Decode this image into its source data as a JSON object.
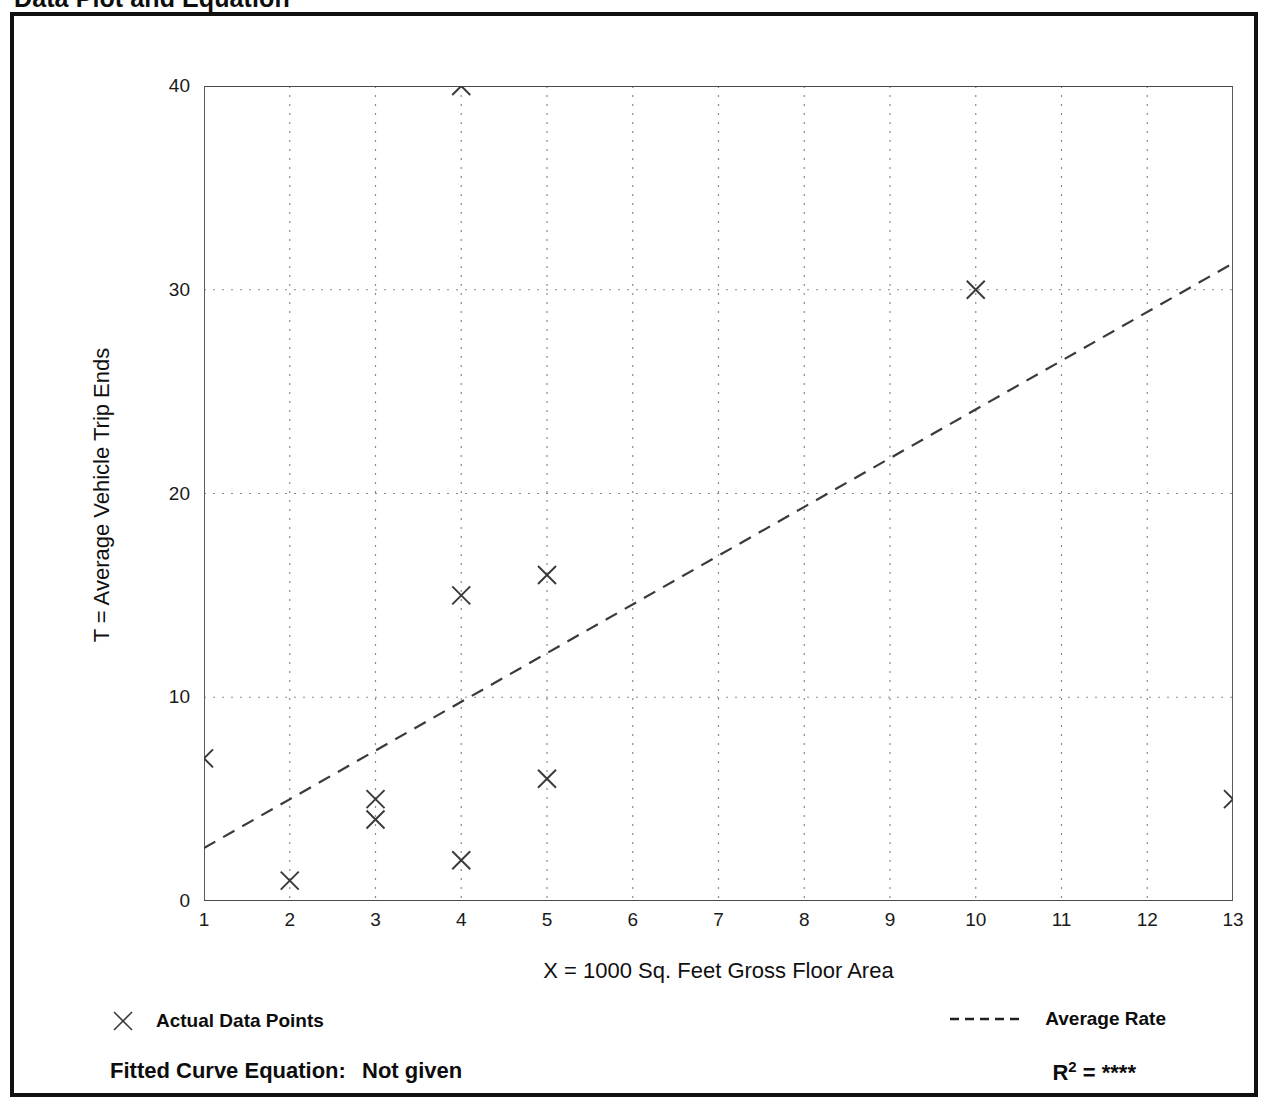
{
  "title": "Data Plot and Equation",
  "legend": {
    "points_label": "Actual Data Points",
    "points_marker": "x-marker-icon",
    "line_label": "Average Rate",
    "line_marker": "dashed-line-icon"
  },
  "footer": {
    "equation_label": "Fitted Curve Equation:",
    "equation_value": "Not given",
    "r_squared_label": "R",
    "r_squared_exponent": "2",
    "r_squared_equals": "=",
    "r_squared_value": "****"
  },
  "colors": {
    "frame": "#111111",
    "axis": "#4a4a4a",
    "grid": "#8a8a8a",
    "marker": "#3a3a3a",
    "trendline": "#3a3a3a",
    "text": "#111111",
    "background": "#ffffff"
  },
  "chart_data": {
    "type": "scatter",
    "title": "Data Plot and Equation",
    "xlabel": "X = 1000 Sq. Feet Gross Floor Area",
    "ylabel": "T = Average Vehicle Trip Ends",
    "xlim": [
      1,
      13
    ],
    "ylim": [
      0,
      40
    ],
    "xticks": [
      1,
      2,
      3,
      4,
      5,
      6,
      7,
      8,
      9,
      10,
      11,
      12,
      13
    ],
    "xtick_labels": [
      "1",
      "2",
      "3",
      "4",
      "5",
      "6",
      "7",
      "8",
      "9",
      "10",
      "11",
      "12",
      "13"
    ],
    "x_minor_tick_step": 0.5,
    "yticks": [
      0,
      10,
      20,
      30,
      40
    ],
    "ytick_labels": [
      "0",
      "10",
      "20",
      "30",
      "40"
    ],
    "y_minor_ticks": [
      5,
      15,
      25,
      35
    ],
    "grid": true,
    "grid_style": "dotted",
    "grid_x_values": [
      2,
      3,
      4,
      5,
      6,
      7,
      8,
      9,
      10,
      11,
      12
    ],
    "grid_y_values": [
      10,
      20,
      30
    ],
    "legend_position": "below-axes",
    "series": [
      {
        "name": "Actual Data Points",
        "type": "scatter",
        "marker": "x",
        "points": [
          {
            "x": 1,
            "y": 7
          },
          {
            "x": 2,
            "y": 1
          },
          {
            "x": 3,
            "y": 5
          },
          {
            "x": 3,
            "y": 4
          },
          {
            "x": 4,
            "y": 40
          },
          {
            "x": 4,
            "y": 15
          },
          {
            "x": 4,
            "y": 2
          },
          {
            "x": 5,
            "y": 16
          },
          {
            "x": 5,
            "y": 6
          },
          {
            "x": 10,
            "y": 30
          },
          {
            "x": 13,
            "y": 5
          }
        ]
      },
      {
        "name": "Average Rate",
        "type": "line",
        "style": "dashed",
        "points": [
          {
            "x": 1,
            "y": 2.6
          },
          {
            "x": 13,
            "y": 31.3
          }
        ]
      }
    ]
  }
}
